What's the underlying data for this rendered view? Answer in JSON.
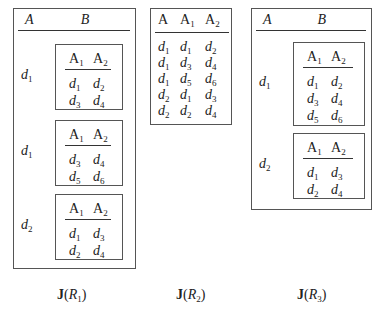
{
  "figure": {
    "tables": [
      {
        "id": "J(R1)",
        "caption": {
          "func": "J",
          "open": "(",
          "rel": "R",
          "sub": "1",
          "close": ")"
        },
        "outer_headers": [
          "A",
          "B"
        ],
        "groups": [
          {
            "a": "d",
            "a_sub": "1",
            "inner_headers": [
              [
                "A",
                "1"
              ],
              [
                "A",
                "2"
              ]
            ],
            "rows": [
              [
                [
                  "d",
                  "1"
                ],
                [
                  "d",
                  "2"
                ]
              ],
              [
                [
                  "d",
                  "3"
                ],
                [
                  "d",
                  "4"
                ]
              ]
            ]
          },
          {
            "a": "d",
            "a_sub": "1",
            "inner_headers": [
              [
                "A",
                "1"
              ],
              [
                "A",
                "2"
              ]
            ],
            "rows": [
              [
                [
                  "d",
                  "3"
                ],
                [
                  "d",
                  "4"
                ]
              ],
              [
                [
                  "d",
                  "5"
                ],
                [
                  "d",
                  "6"
                ]
              ]
            ]
          },
          {
            "a": "d",
            "a_sub": "2",
            "inner_headers": [
              [
                "A",
                "1"
              ],
              [
                "A",
                "2"
              ]
            ],
            "rows": [
              [
                [
                  "d",
                  "1"
                ],
                [
                  "d",
                  "3"
                ]
              ],
              [
                [
                  "d",
                  "2"
                ],
                [
                  "d",
                  "4"
                ]
              ]
            ]
          }
        ]
      },
      {
        "id": "J(R2)",
        "caption": {
          "func": "J",
          "open": "(",
          "rel": "R",
          "sub": "2",
          "close": ")"
        },
        "headers": [
          [
            "A",
            ""
          ],
          [
            "A",
            "1"
          ],
          [
            "A",
            "2"
          ]
        ],
        "rows": [
          [
            [
              "d",
              "1"
            ],
            [
              "d",
              "1"
            ],
            [
              "d",
              "2"
            ]
          ],
          [
            [
              "d",
              "1"
            ],
            [
              "d",
              "3"
            ],
            [
              "d",
              "4"
            ]
          ],
          [
            [
              "d",
              "1"
            ],
            [
              "d",
              "5"
            ],
            [
              "d",
              "6"
            ]
          ],
          [
            [
              "d",
              "2"
            ],
            [
              "d",
              "1"
            ],
            [
              "d",
              "3"
            ]
          ],
          [
            [
              "d",
              "2"
            ],
            [
              "d",
              "2"
            ],
            [
              "d",
              "4"
            ]
          ]
        ]
      },
      {
        "id": "J(R3)",
        "caption": {
          "func": "J",
          "open": "(",
          "rel": "R",
          "sub": "3",
          "close": ")"
        },
        "outer_headers": [
          "A",
          "B"
        ],
        "groups": [
          {
            "a": "d",
            "a_sub": "1",
            "inner_headers": [
              [
                "A",
                "1"
              ],
              [
                "A",
                "2"
              ]
            ],
            "rows": [
              [
                [
                  "d",
                  "1"
                ],
                [
                  "d",
                  "2"
                ]
              ],
              [
                [
                  "d",
                  "3"
                ],
                [
                  "d",
                  "4"
                ]
              ],
              [
                [
                  "d",
                  "5"
                ],
                [
                  "d",
                  "6"
                ]
              ]
            ]
          },
          {
            "a": "d",
            "a_sub": "2",
            "inner_headers": [
              [
                "A",
                "1"
              ],
              [
                "A",
                "2"
              ]
            ],
            "rows": [
              [
                [
                  "d",
                  "1"
                ],
                [
                  "d",
                  "3"
                ]
              ],
              [
                [
                  "d",
                  "2"
                ],
                [
                  "d",
                  "4"
                ]
              ]
            ]
          }
        ]
      }
    ]
  }
}
